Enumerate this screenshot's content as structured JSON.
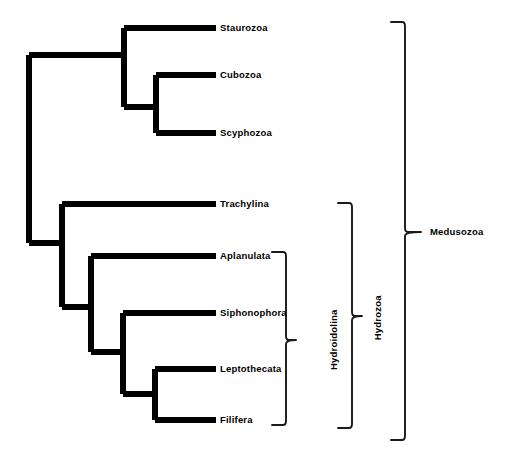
{
  "diagram": {
    "type": "cladogram",
    "background_color": "#ffffff",
    "branch_color": "#000000",
    "bracket_color": "#1a1a1a",
    "taxa": [
      {
        "name": "Staurozoa",
        "tip_y": 28,
        "branch_x": 124
      },
      {
        "name": "Cubozoa",
        "tip_y": 75,
        "branch_x": 156
      },
      {
        "name": "Scyphozoa",
        "tip_y": 133,
        "branch_x": 156
      },
      {
        "name": "Trachylina",
        "tip_y": 204,
        "branch_x": 62
      },
      {
        "name": "Aplanulata",
        "tip_y": 256,
        "branch_x": 91
      },
      {
        "name": "Siphonophora",
        "tip_y": 313,
        "branch_x": 123
      },
      {
        "name": "Leptothecata",
        "tip_y": 369,
        "branch_x": 155
      },
      {
        "name": "Filifera",
        "tip_y": 420,
        "branch_x": 155
      }
    ],
    "clades": [
      {
        "name": "Hydroidolina",
        "orientation": "vertical",
        "top": 252,
        "bottom": 425,
        "tick": 340,
        "x": 286,
        "label_x": 334,
        "label_y": 340
      },
      {
        "name": "Hydrozoa",
        "orientation": "vertical",
        "top": 203,
        "bottom": 428,
        "tick": 316,
        "x": 352,
        "label_x": 378,
        "label_y": 318
      },
      {
        "name": "Medusozoa",
        "orientation": "horizontal",
        "top": 22,
        "bottom": 440,
        "tick": 232,
        "x": 405,
        "label_x": 430,
        "label_y": 232
      }
    ]
  }
}
